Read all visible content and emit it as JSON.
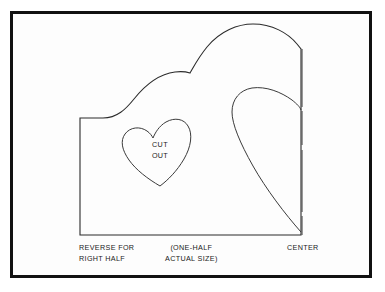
{
  "page": {
    "background_color": "#ffffff",
    "frame_color": "#111111",
    "line_color": "#2b2b2b",
    "width": 385,
    "height": 292
  },
  "pattern": {
    "cutout_label": "CUT\nOUT",
    "center_line_label": "CENTER",
    "reverse_label": "REVERSE FOR\nRIGHT HALF",
    "scale_label": "(ONE-HALF\nACTUAL SIZE)"
  },
  "shapes": {
    "outer_half_heart": {
      "name": "outer-half-heart-outline",
      "description": "Large half-heart pattern piece, left straight edge, bottom straight edge, center vertical edge at right"
    },
    "inner_half_heart": {
      "name": "inner-half-heart-outline",
      "description": "Second smaller half-heart curve inside the pattern piece, nested against the center line"
    },
    "small_heart_cutout": {
      "name": "small-heart-cutout-outline",
      "description": "Small tilted heart-shaped cut-out marked CUT OUT"
    }
  }
}
